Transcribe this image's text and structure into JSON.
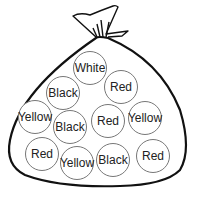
{
  "diagram": {
    "balls": [
      {
        "label": "White",
        "cx": 90,
        "cy": 68
      },
      {
        "label": "Black",
        "cx": 63,
        "cy": 93
      },
      {
        "label": "Red",
        "cx": 121,
        "cy": 87
      },
      {
        "label": "Yellow",
        "cx": 35,
        "cy": 117
      },
      {
        "label": "Black",
        "cx": 70,
        "cy": 127
      },
      {
        "label": "Red",
        "cx": 108,
        "cy": 121
      },
      {
        "label": "Yellow",
        "cx": 145,
        "cy": 118
      },
      {
        "label": "Red",
        "cx": 42,
        "cy": 154
      },
      {
        "label": "Yellow",
        "cx": 77,
        "cy": 163
      },
      {
        "label": "Black",
        "cx": 113,
        "cy": 160
      },
      {
        "label": "Red",
        "cx": 153,
        "cy": 156
      }
    ],
    "counts": {
      "White": 1,
      "Black": 3,
      "Red": 4,
      "Yellow": 3
    }
  }
}
